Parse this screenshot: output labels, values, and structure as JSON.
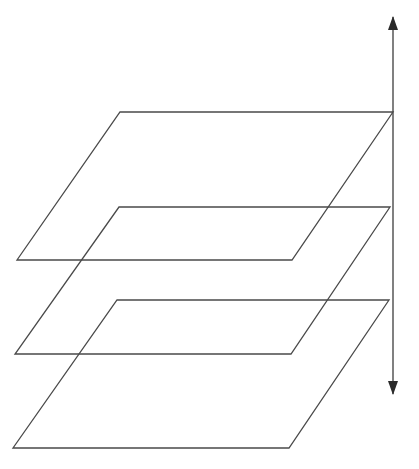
{
  "diagram": {
    "stroke_color": "#4a4a4a",
    "background": "#ffffff",
    "planes": [
      {
        "name": "top-plane",
        "points": [
          [
            120,
            112
          ],
          [
            393,
            112
          ],
          [
            292,
            260
          ],
          [
            17,
            260
          ]
        ]
      },
      {
        "name": "middle-plane",
        "points": [
          [
            119,
            207
          ],
          [
            390,
            207
          ],
          [
            291,
            354
          ],
          [
            15,
            354
          ]
        ]
      },
      {
        "name": "bottom-plane",
        "points": [
          [
            117,
            300
          ],
          [
            389,
            300
          ],
          [
            289,
            448
          ],
          [
            13,
            448
          ]
        ]
      }
    ],
    "arrow": {
      "x": 393,
      "y_top": 17,
      "y_bottom": 394,
      "double_headed": true
    }
  }
}
